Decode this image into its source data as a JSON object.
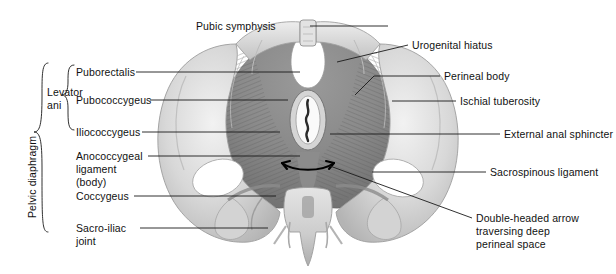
{
  "figure": {
    "title_alt": "Female pelvic floor, inferior view",
    "background": "#ffffff",
    "ink": "#1a1a1a"
  },
  "brace_labels": {
    "pelvic_diaphragm": "Pelvic diaphragm",
    "levator_ani_line1": "Levator",
    "levator_ani_line2": "ani"
  },
  "left_labels": [
    {
      "id": "puborectalis",
      "text": "Puborectalis"
    },
    {
      "id": "pubococcygeus",
      "text": "Pubococcygeus"
    },
    {
      "id": "iliococcygeus",
      "text": "Iliococcygeus"
    },
    {
      "id": "anococcygeal-1",
      "text": "Anococcygeal"
    },
    {
      "id": "anococcygeal-2",
      "text": "ligament"
    },
    {
      "id": "anococcygeal-3",
      "text": "(body)"
    },
    {
      "id": "coccygeus",
      "text": "Coccygeus"
    },
    {
      "id": "sacroiliac-1",
      "text": "Sacro-iliac"
    },
    {
      "id": "sacroiliac-2",
      "text": "joint"
    }
  ],
  "right_labels": [
    {
      "id": "pubic-symphysis",
      "text": "Pubic symphysis"
    },
    {
      "id": "urogenital-hiatus",
      "text": "Urogenital hiatus"
    },
    {
      "id": "perineal-body",
      "text": "Perineal body"
    },
    {
      "id": "ischial-tuberosity",
      "text": "Ischial tuberosity"
    },
    {
      "id": "external-anal-sphincter",
      "text": "External anal sphincter"
    },
    {
      "id": "sacrospinous-ligament",
      "text": "Sacrospinous ligament"
    },
    {
      "id": "double-arrow-1",
      "text": "Double-headed arrow"
    },
    {
      "id": "double-arrow-2",
      "text": "traversing deep"
    },
    {
      "id": "double-arrow-3",
      "text": "perineal space"
    }
  ],
  "annotations": {
    "double_headed_arrow": "double-headed-arrow"
  }
}
